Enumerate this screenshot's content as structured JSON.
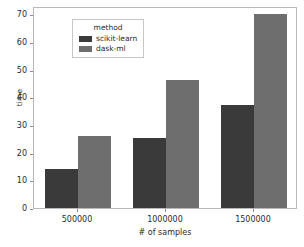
{
  "chart_data": {
    "type": "bar",
    "title": "",
    "xlabel": "# of samples",
    "ylabel": "time",
    "categories": [
      "500000",
      "1000000",
      "1500000"
    ],
    "series": [
      {
        "name": "scikit-learn",
        "values": [
          14,
          25.2,
          37.4
        ],
        "color": "#3a3a3a"
      },
      {
        "name": "dask-ml",
        "values": [
          26,
          46.2,
          70
        ],
        "color": "#6e6e6e"
      }
    ],
    "ylim": [
      0,
      73
    ],
    "yticks": [
      0,
      10,
      20,
      30,
      40,
      50,
      60,
      70
    ],
    "ytick_labels": [
      "0",
      "10",
      "20",
      "30",
      "40",
      "50",
      "60",
      "70"
    ],
    "grid": false,
    "legend": {
      "title": "method",
      "position": "upper left",
      "entries": [
        "scikit-learn",
        "dask-ml"
      ]
    }
  },
  "figure": {
    "background_color": "#ffffff",
    "axes_edge_color": "#b9b9b9",
    "tick_color": "#8c8c8c",
    "text_color": "#2b2b2b"
  }
}
